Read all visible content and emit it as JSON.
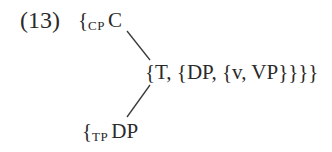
{
  "example": {
    "number": "(13)"
  },
  "nodes": {
    "cp": {
      "brace": "{",
      "label": "CP",
      "head": "C"
    },
    "t": {
      "text": "{T, {DP, {v, VP}}}}"
    },
    "tp": {
      "brace": "{",
      "label": "TP",
      "head": "DP"
    }
  },
  "edges": [
    {
      "from": "cp",
      "to": "t"
    },
    {
      "from": "tp",
      "to": "t"
    }
  ],
  "colors": {
    "text": "#2a2a2a",
    "line": "#3a3a3a",
    "background": "#ffffff"
  }
}
